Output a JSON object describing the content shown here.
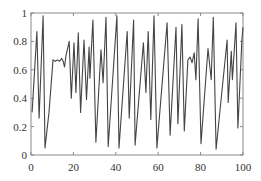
{
  "chart_data": {
    "type": "line",
    "title": "",
    "xlabel": "",
    "ylabel": "",
    "xlim": [
      0,
      100
    ],
    "ylim": [
      0,
      1
    ],
    "grid": false,
    "legend": null,
    "x_ticks": [
      0,
      20,
      40,
      60,
      80,
      100
    ],
    "x_tick_labels": [
      "0",
      "20",
      "40",
      "60",
      "80",
      "100"
    ],
    "y_ticks": [
      0,
      0.2,
      0.4,
      0.6,
      0.8,
      1
    ],
    "y_tick_labels": [
      "0",
      "0.2",
      "0.4",
      "0.6",
      "0.8",
      "1"
    ],
    "colors": {
      "line": "#444444",
      "axis": "#8a8a8a",
      "text": "#333333"
    },
    "series": [
      {
        "name": "signal",
        "x": [
          0.5,
          2.8,
          3.8,
          5.7,
          6.6,
          8.5,
          10.4,
          11.5,
          12.5,
          13.5,
          14.5,
          15.2,
          15.8,
          16.5,
          18.0,
          19.0,
          20.3,
          21.2,
          22.3,
          23.4,
          25.0,
          26.2,
          27.4,
          27.8,
          29.2,
          30.6,
          33.0,
          34.0,
          35.4,
          36.4,
          40.5,
          41.5,
          45.4,
          46.3,
          48.4,
          49.1,
          53.0,
          54.2,
          55.3,
          56.5,
          58.0,
          59.4,
          64.2,
          65.6,
          68.4,
          69.3,
          71.2,
          72.3,
          74.0,
          75.0,
          76.0,
          77.0,
          77.8,
          78.8,
          80.2,
          83.5,
          85.0,
          86.0,
          87.3,
          92.5,
          93.0,
          94.5,
          95.0,
          96.7,
          97.6,
          99.5,
          100.0
        ],
        "y": [
          0.3,
          0.87,
          0.26,
          0.98,
          0.05,
          0.3,
          0.67,
          0.66,
          0.67,
          0.66,
          0.68,
          0.66,
          0.62,
          0.7,
          0.8,
          0.4,
          0.79,
          0.44,
          0.86,
          0.3,
          0.81,
          0.39,
          0.76,
          0.54,
          0.95,
          0.09,
          0.74,
          0.51,
          0.97,
          0.06,
          0.98,
          0.05,
          0.87,
          0.26,
          0.95,
          0.07,
          0.79,
          0.44,
          0.87,
          0.25,
          0.98,
          0.05,
          0.93,
          0.14,
          0.9,
          0.22,
          0.92,
          0.17,
          0.67,
          0.69,
          0.65,
          0.72,
          0.53,
          0.96,
          0.08,
          0.75,
          0.53,
          0.97,
          0.04,
          0.81,
          0.37,
          0.73,
          0.53,
          0.93,
          0.19,
          0.81,
          0.9
        ]
      }
    ]
  }
}
